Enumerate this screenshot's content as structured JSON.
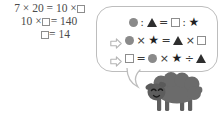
{
  "solution": {
    "label": "worked solution",
    "lines": [
      {
        "id": "line1",
        "pre": "7 × 20 = 10 ×",
        "post": "",
        "has_box": true,
        "text": "7×20=10×□"
      },
      {
        "id": "line2",
        "pre": "10 ×",
        "post": "= 140",
        "has_box": true,
        "text": "10×□=140"
      },
      {
        "id": "line3",
        "pre": "",
        "post": "= 14",
        "has_box": true,
        "text": "□=14"
      }
    ]
  },
  "bubble": {
    "label": "speech bubble",
    "lines": [
      {
        "id": "proportion",
        "text": "● : ▲ = □ : ★",
        "has_arrow": false,
        "tokens": [
          {
            "type": "circle"
          },
          {
            "type": "op",
            "text": ":"
          },
          {
            "type": "triangle"
          },
          {
            "type": "op",
            "text": "="
          },
          {
            "type": "square"
          },
          {
            "type": "op",
            "text": ":"
          },
          {
            "type": "star",
            "text": "★"
          }
        ]
      },
      {
        "id": "cross-product",
        "text": "⇨ ● × ★ = ▲ × □",
        "has_arrow": true,
        "tokens": [
          {
            "type": "arrow"
          },
          {
            "type": "circle"
          },
          {
            "type": "op",
            "text": "×"
          },
          {
            "type": "star",
            "text": "★"
          },
          {
            "type": "op",
            "text": "="
          },
          {
            "type": "triangle"
          },
          {
            "type": "op",
            "text": "×"
          },
          {
            "type": "square"
          }
        ]
      },
      {
        "id": "solve-for-box",
        "text": "⇨ □ = ● × ★ ÷ ▲",
        "has_arrow": true,
        "tokens": [
          {
            "type": "arrow"
          },
          {
            "type": "square"
          },
          {
            "type": "op",
            "text": "="
          },
          {
            "type": "circle"
          },
          {
            "type": "op",
            "text": "×"
          },
          {
            "type": "star",
            "text": "★"
          },
          {
            "type": "op",
            "text": "÷"
          },
          {
            "type": "triangle"
          }
        ]
      }
    ]
  },
  "sheep": {
    "label": "sheep character",
    "body_color": "#6b6b6b",
    "outline_color": "#5a5a5a",
    "face_color": "#5d5d5d"
  },
  "colors": {
    "text": "#4a4a4a",
    "bubble_border": "#bdbdbd",
    "circle": "#8a8a8a",
    "triangle": "#2e2e2e",
    "square_border": "#8d8d8d",
    "star": "#1f1f1f",
    "arrow": "#b5b5b5",
    "background": "#ffffff"
  }
}
